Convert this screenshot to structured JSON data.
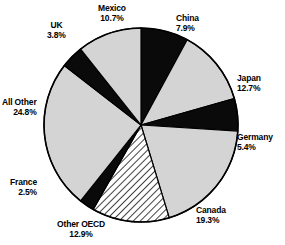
{
  "chart_data": {
    "type": "pie",
    "title": "",
    "subtitle": "",
    "xlabel": "",
    "ylabel": "",
    "legend_position": "none",
    "grid": false,
    "labels_show_percent": true,
    "total_percent": 100.0,
    "start_angle_deg": 0,
    "direction": "clockwise",
    "categories": [
      "China",
      "Japan",
      "Germany",
      "Canada",
      "Other OECD",
      "France",
      "All Other",
      "UK",
      "Mexico"
    ],
    "values": [
      7.9,
      12.7,
      5.4,
      19.3,
      12.9,
      2.5,
      24.8,
      3.8,
      10.7
    ],
    "slices": [
      {
        "name": "China",
        "value": 7.9,
        "percent_text": "7.9%",
        "fill": "black",
        "color": "#0a0a0a",
        "label_align": "left",
        "label_x": 176,
        "label_y": 14
      },
      {
        "name": "Japan",
        "value": 12.7,
        "percent_text": "12.7%",
        "fill": "light-gray",
        "color": "#d4d4d4",
        "label_align": "left",
        "label_y": 74,
        "label_x": 237
      },
      {
        "name": "Germany",
        "value": 5.4,
        "percent_text": "5.4%",
        "fill": "black",
        "color": "#0a0a0a",
        "label_align": "left",
        "label_x": 237,
        "label_y": 133
      },
      {
        "name": "Canada",
        "value": 19.3,
        "percent_text": "19.3%",
        "fill": "light-gray",
        "color": "#d4d4d4",
        "label_align": "left",
        "label_x": 196,
        "label_y": 206
      },
      {
        "name": "Other OECD",
        "value": 12.9,
        "percent_text": "12.9%",
        "fill": "diagonal-hatch",
        "color": "#ffffff",
        "label_align": "center",
        "label_x": 57,
        "label_y": 220
      },
      {
        "name": "France",
        "value": 2.5,
        "percent_text": "2.5%",
        "fill": "black",
        "color": "#0a0a0a",
        "label_align": "right",
        "label_x": 10,
        "label_y": 178
      },
      {
        "name": "All Other",
        "value": 24.8,
        "percent_text": "24.8%",
        "fill": "light-gray",
        "color": "#d4d4d4",
        "label_align": "right",
        "label_x": 2,
        "label_y": 98
      },
      {
        "name": "UK",
        "value": 3.8,
        "percent_text": "3.8%",
        "fill": "black",
        "color": "#0a0a0a",
        "label_align": "center",
        "label_x": 47,
        "label_y": 21
      },
      {
        "name": "Mexico",
        "value": 10.7,
        "percent_text": "10.7%",
        "fill": "light-gray",
        "color": "#d4d4d4",
        "label_align": "center",
        "label_x": 98,
        "label_y": 4
      }
    ]
  },
  "figure": {
    "background": "#ffffff",
    "outline_color": "#000000",
    "center_x": 141,
    "center_y": 125,
    "radius": 97
  }
}
